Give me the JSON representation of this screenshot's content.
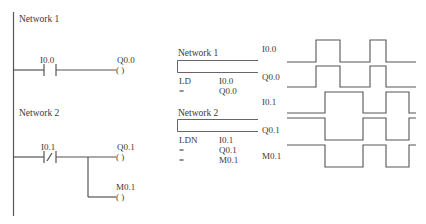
{
  "ladder": {
    "networks": [
      {
        "title": "Network  1",
        "contact": {
          "type": "NO",
          "operand": "I0.0",
          "symbol": "| |"
        },
        "coils": [
          {
            "operand": "Q0.0",
            "symbol": "( )"
          }
        ]
      },
      {
        "title": "Network  2",
        "contact": {
          "type": "NC",
          "operand": "I0.1",
          "symbol": "|/|"
        },
        "coils": [
          {
            "operand": "Q0.1",
            "symbol": "( )"
          },
          {
            "operand": "M0.1",
            "symbol": "( )"
          }
        ]
      }
    ]
  },
  "stl": {
    "networks": [
      {
        "title": "Network  1",
        "lines": [
          {
            "op": "LD",
            "operand": "I0.0"
          },
          {
            "op": "=",
            "operand": "Q0.0"
          }
        ]
      },
      {
        "title": "Network  2",
        "lines": [
          {
            "op": "LDN",
            "operand": "I0.1"
          },
          {
            "op": "=",
            "operand": "Q0.1"
          },
          {
            "op": "=",
            "operand": "M0.1"
          }
        ]
      }
    ]
  },
  "timing": {
    "signals": [
      {
        "name": "I0.0",
        "transitions_x": [
          316,
          340,
          370,
          386
        ]
      },
      {
        "name": "Q0.0",
        "transitions_x": [
          316,
          340,
          370,
          386
        ]
      },
      {
        "name": "I0.1",
        "transitions_x": [
          325,
          363,
          386,
          409
        ]
      },
      {
        "name": "Q0.1",
        "transitions_x": [
          325,
          363,
          386,
          409
        ],
        "inverted": true
      },
      {
        "name": "M0.1",
        "transitions_x": [
          325,
          363,
          386,
          409
        ],
        "inverted": true
      }
    ]
  },
  "colors": {
    "line": "#555555",
    "text": "#3a3a3a",
    "background": "#ffffff"
  }
}
